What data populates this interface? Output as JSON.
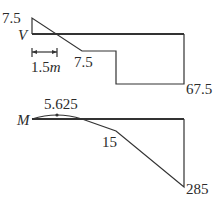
{
  "shear_diagram": {
    "symbol": "V",
    "left_value": "7.5",
    "mid_value": "7.5",
    "right_value": "67.5",
    "dimension_label": "1.5",
    "dimension_unit": "m"
  },
  "moment_diagram": {
    "symbol": "M",
    "peak_value": "5.625",
    "mid_value": "15",
    "right_value": "285"
  },
  "colors": {
    "line": "#333333",
    "text": "#2b2b2b",
    "background": "#ffffff"
  }
}
